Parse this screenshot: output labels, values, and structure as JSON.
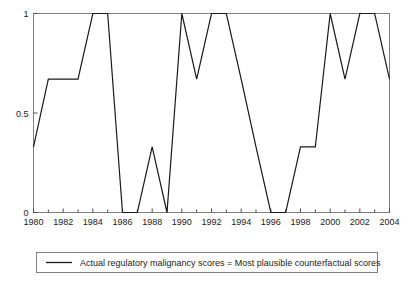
{
  "chart_data": {
    "type": "line",
    "title": "",
    "subtitle": "",
    "xlabel": "",
    "ylabel": "",
    "x": [
      1980,
      1981,
      1982,
      1983,
      1984,
      1985,
      1986,
      1987,
      1988,
      1989,
      1990,
      1991,
      1992,
      1993,
      1994,
      1995,
      1996,
      1997,
      1998,
      1999,
      2000,
      2001,
      2002,
      2003,
      2004
    ],
    "values": [
      0.33,
      0.67,
      0.67,
      0.67,
      1,
      1,
      0,
      0,
      0.33,
      0,
      1,
      0.67,
      1,
      1,
      0.67,
      0.33,
      0,
      0,
      0.33,
      0.33,
      1,
      0.67,
      1,
      1,
      0.67
    ],
    "series": [
      {
        "name": "Actual regulatory malignancy scores = Most plausible counterfactual scores",
        "values": [
          0.33,
          0.67,
          0.67,
          0.67,
          1,
          1,
          0,
          0,
          0.33,
          0,
          1,
          0.67,
          1,
          1,
          0.67,
          0.33,
          0,
          0,
          0.33,
          0.33,
          1,
          0.67,
          1,
          1,
          0.67
        ]
      }
    ],
    "xlim": [
      1980,
      2004
    ],
    "ylim": [
      0,
      1
    ],
    "ytick_labels": [
      "0",
      "0.5",
      "1"
    ],
    "ytick_values": [
      0,
      0.5,
      1
    ],
    "xtick_labels": [
      "1980",
      "1982",
      "1984",
      "1986",
      "1988",
      "1990",
      "1992",
      "1994",
      "1996",
      "1998",
      "2000",
      "2002",
      "2004"
    ],
    "xtick_values": [
      1980,
      1982,
      1984,
      1986,
      1988,
      1990,
      1992,
      1994,
      1996,
      1998,
      2000,
      2002,
      2004
    ],
    "xtick_minor_values": [
      1981,
      1983,
      1985,
      1987,
      1989,
      1991,
      1993,
      1995,
      1997,
      1999,
      2001,
      2003
    ],
    "grid": false,
    "legend_position": "below",
    "line_color": "#1a1a1a",
    "axis_color": "#4d4d4d",
    "background_color": "#ffffff"
  },
  "legend": {
    "entries": [
      {
        "label": "Actual regulatory malignancy scores = Most plausible counterfactual scores",
        "swatch": "line-sample"
      }
    ]
  }
}
